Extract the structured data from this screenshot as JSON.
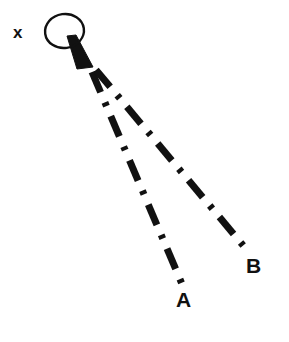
{
  "figure": {
    "type": "optical-ray-diagram",
    "background_color": "#ffffff",
    "ink_color": "#111111",
    "width": 289,
    "height": 342,
    "labels": {
      "source": "x",
      "ray_a": "A",
      "ray_b": "B"
    },
    "source_marker": {
      "shape": "ellipse-with-cone",
      "ellipse": {
        "cx": 64.5,
        "cy": 31,
        "rx": 19.5,
        "ry": 17,
        "rotation_deg": -8,
        "stroke_width": 2.4,
        "filled": false
      },
      "cone": {
        "apex_x": 71,
        "apex_y": 38,
        "base_left_x": 77,
        "base_left_y": 69,
        "base_right_x": 93,
        "base_right_y": 67,
        "filled": true
      }
    },
    "rays": [
      {
        "name": "A",
        "label": "A",
        "start_x": 92,
        "start_y": 72,
        "end_x": 182,
        "end_y": 284,
        "style": "dash-dot",
        "stroke_width": 7,
        "dash_len": 22,
        "dot_len": 4,
        "gap_len": 11
      },
      {
        "name": "B",
        "label": "B",
        "start_x": 96,
        "start_y": 70,
        "end_x": 247,
        "end_y": 250,
        "style": "dash-dot",
        "stroke_width": 7,
        "dash_len": 22,
        "dot_len": 4,
        "gap_len": 11
      }
    ]
  }
}
